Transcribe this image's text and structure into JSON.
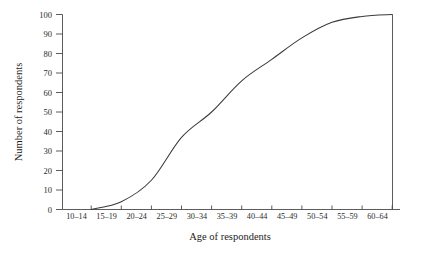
{
  "chart_data": {
    "type": "line",
    "title": "",
    "subtitle": "",
    "xlabel": "Age of respondents",
    "ylabel": "Number of respondents",
    "categories": [
      "10–14",
      "15–19",
      "20–24",
      "25–29",
      "30–34",
      "35–39",
      "40–44",
      "45–49",
      "50–54",
      "55–59",
      "60–64"
    ],
    "x_tick_labels": [
      "10–14",
      "15–19",
      "20–24",
      "25–29",
      "30–34",
      "35–39",
      "40–44",
      "45–49",
      "50–54",
      "55–59",
      "60–64"
    ],
    "y_tick_labels": [
      "0",
      "10",
      "20",
      "30",
      "40",
      "50",
      "60",
      "70",
      "80",
      "90",
      "100"
    ],
    "y_ticks": [
      0,
      10,
      20,
      30,
      40,
      50,
      60,
      70,
      80,
      90,
      100
    ],
    "ylim": [
      0,
      100
    ],
    "values": [
      0,
      4,
      15,
      37,
      50,
      66,
      77,
      88,
      96,
      99,
      100
    ],
    "series": [
      {
        "name": "Cumulative number of respondents",
        "values": [
          0,
          4,
          15,
          37,
          50,
          66,
          77,
          88,
          96,
          99,
          100
        ]
      }
    ],
    "grid": false,
    "legend": false,
    "legend_position": "none",
    "line_color": "#3a3a3a",
    "axis_color": "#4a4a4a",
    "background_color": "#ffffff"
  }
}
